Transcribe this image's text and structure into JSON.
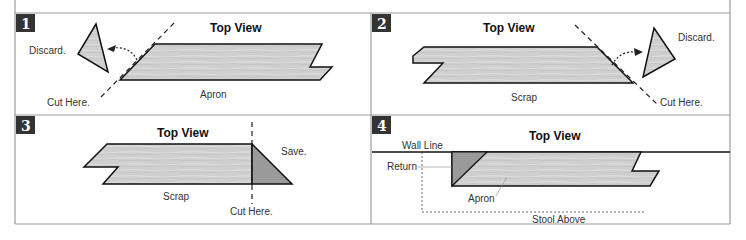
{
  "panels": [
    {
      "number": "1",
      "title": "Top View",
      "labels": {
        "discard": "Discard.",
        "cut": "Cut Here.",
        "piece": "Apron"
      }
    },
    {
      "number": "2",
      "title": "Top View",
      "labels": {
        "discard": "Discard.",
        "cut": "Cut Here.",
        "piece": "Scrap"
      }
    },
    {
      "number": "3",
      "title": "Top View",
      "labels": {
        "save": "Save.",
        "cut": "Cut Here.",
        "piece": "Scrap"
      }
    },
    {
      "number": "4",
      "title": "Top View",
      "labels": {
        "wall": "Wall Line",
        "return": "Return",
        "piece": "Apron",
        "stool": "Stool Above"
      }
    }
  ],
  "colors": {
    "wood": "#cfcfcf",
    "wood_dark": "#9a9a9a",
    "frame": "#888888",
    "badge": "#333333"
  }
}
